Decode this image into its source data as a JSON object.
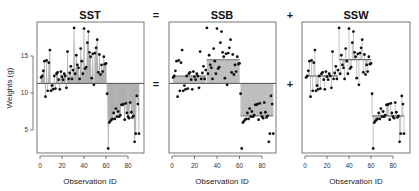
{
  "figure": {
    "operators": [
      "=",
      "+"
    ],
    "ylabel": "Weights (g)",
    "xlabel": "Observation ID"
  },
  "colors": {
    "point": "#111111",
    "fill": "#c8c8c8",
    "segment": "#9a9a9a",
    "mean_line": "#555555",
    "frame": "#555555"
  },
  "chart_data": [
    {
      "type": "scatter",
      "title": "SST",
      "xlabel": "Observation ID",
      "ylabel": "Weights (g)",
      "x_ticks": [
        0,
        20,
        40,
        60,
        80
      ],
      "y_ticks": [
        5,
        10,
        15
      ],
      "xlim": [
        -2,
        94
      ],
      "ylim": [
        2,
        19.5
      ],
      "reference": "grand_mean",
      "grand_mean": 11.3,
      "annotation": "Vertical segments and shaded area from each point to the grand mean"
    },
    {
      "type": "scatter",
      "title": "SSB",
      "xlabel": "Observation ID",
      "x_ticks": [
        0,
        20,
        40,
        60,
        80
      ],
      "xlim": [
        -2,
        94
      ],
      "ylim": [
        2,
        19.5
      ],
      "reference": "group_means_vs_grand_mean",
      "grand_mean": 11.3,
      "group_means": [
        {
          "group": 1,
          "x_range": [
            1,
            30
          ],
          "mean": 12.3
        },
        {
          "group": 2,
          "x_range": [
            31,
            60
          ],
          "mean": 14.5
        },
        {
          "group": 3,
          "x_range": [
            61,
            90
          ],
          "mean": 6.9
        }
      ],
      "annotation": "Shaded rectangles between group means and grand mean"
    },
    {
      "type": "scatter",
      "title": "SSW",
      "xlabel": "Observation ID",
      "x_ticks": [
        0,
        20,
        40,
        60,
        80
      ],
      "xlim": [
        -2,
        94
      ],
      "ylim": [
        2,
        19.5
      ],
      "reference": "group_means",
      "group_means": [
        {
          "group": 1,
          "x_range": [
            1,
            30
          ],
          "mean": 12.3
        },
        {
          "group": 2,
          "x_range": [
            31,
            60
          ],
          "mean": 14.5
        },
        {
          "group": 3,
          "x_range": [
            61,
            90
          ],
          "mean": 6.9
        }
      ],
      "annotation": "Vertical segments from each point to its group mean"
    }
  ],
  "observations": {
    "x": [
      1,
      2,
      3,
      4,
      5,
      6,
      7,
      8,
      9,
      10,
      11,
      12,
      13,
      14,
      15,
      16,
      17,
      18,
      19,
      20,
      21,
      22,
      23,
      24,
      25,
      26,
      27,
      28,
      29,
      30,
      31,
      32,
      33,
      34,
      35,
      36,
      37,
      38,
      39,
      40,
      41,
      42,
      43,
      44,
      45,
      46,
      47,
      48,
      49,
      50,
      51,
      52,
      53,
      54,
      55,
      56,
      57,
      58,
      59,
      60,
      61,
      62,
      63,
      64,
      65,
      66,
      67,
      68,
      69,
      70,
      71,
      72,
      73,
      74,
      75,
      76,
      77,
      78,
      79,
      80,
      81,
      82,
      83,
      84,
      85,
      86,
      87,
      88,
      89,
      90
    ],
    "y": [
      12.1,
      12.3,
      13.0,
      14.3,
      9.5,
      14.4,
      10.3,
      14.1,
      15.8,
      10.3,
      11.0,
      10.5,
      12.3,
      10.6,
      12.6,
      12.8,
      11.8,
      10.5,
      12.9,
      12.2,
      11.8,
      12.6,
      12.3,
      10.7,
      15.6,
      11.9,
      12.7,
      13.6,
      11.9,
      13.1,
      18.8,
      12.6,
      15.1,
      13.8,
      13.4,
      11.9,
      16.0,
      14.3,
      12.6,
      18.7,
      13.3,
      13.5,
      16.8,
      18.3,
      15.5,
      14.9,
      12.0,
      15.3,
      11.1,
      15.4,
      16.1,
      17.2,
      12.8,
      15.2,
      12.5,
      13.8,
      12.9,
      14.9,
      13.9,
      14.0,
      9.9,
      2.5,
      6.0,
      6.2,
      6.4,
      6.5,
      7.3,
      6.5,
      7.9,
      6.8,
      7.5,
      6.8,
      7.0,
      8.4,
      8.4,
      8.5,
      6.4,
      8.6,
      7.3,
      6.8,
      6.6,
      8.7,
      7.4,
      6.7,
      6.9,
      3.4,
      4.5,
      9.6,
      8.5,
      4.5
    ]
  }
}
